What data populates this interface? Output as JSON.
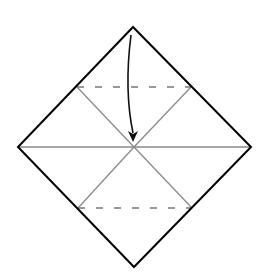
{
  "diagram": {
    "type": "origami-fold-step",
    "background": "#ffffff",
    "outline_color": "#000000",
    "crease_color": "#888888",
    "valley_fold_color": "#777777",
    "arrow_color": "#111111",
    "square": {
      "top": [
        133,
        27
      ],
      "right": [
        251,
        147
      ],
      "bottom": [
        134,
        267
      ],
      "left": [
        18,
        147
      ]
    },
    "creases": [
      {
        "name": "horizontal-diagonal",
        "from": [
          18,
          147
        ],
        "to": [
          251,
          147
        ]
      },
      {
        "name": "upper-left-crease",
        "from": [
          77,
          87
        ],
        "to": [
          134,
          147
        ]
      },
      {
        "name": "upper-right-crease",
        "from": [
          191,
          87
        ],
        "to": [
          134,
          147
        ]
      },
      {
        "name": "lower-left-crease",
        "from": [
          78,
          208
        ],
        "to": [
          134,
          147
        ]
      },
      {
        "name": "lower-right-crease",
        "from": [
          192,
          208
        ],
        "to": [
          134,
          147
        ]
      }
    ],
    "valley_folds": [
      {
        "name": "top-valley-fold",
        "from": [
          77,
          87
        ],
        "to": [
          191,
          87
        ]
      },
      {
        "name": "bottom-valley-fold",
        "from": [
          78,
          208
        ],
        "to": [
          192,
          208
        ]
      }
    ],
    "arrow": {
      "meaning": "fold top corner down to center",
      "start": [
        131,
        35
      ],
      "end": [
        133,
        141
      ]
    }
  }
}
